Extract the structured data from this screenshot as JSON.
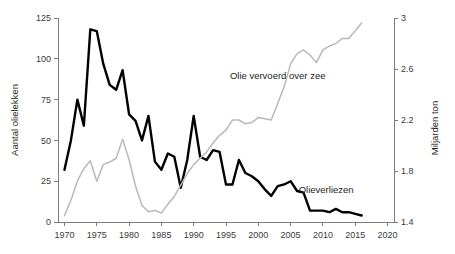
{
  "chart_data": {
    "type": "line",
    "title": "",
    "subtitle": "",
    "xlabel": "",
    "ylabel": "Aantal olielekken",
    "y2label": "Miljarden ton",
    "xlim": [
      1969,
      2021
    ],
    "ylim": [
      0,
      125
    ],
    "y2lim": [
      1.4,
      3.0
    ],
    "grid": false,
    "legend_position": "inline-annotation",
    "xticks": [
      1970,
      1975,
      1980,
      1985,
      1990,
      1995,
      2000,
      2005,
      2010,
      2015,
      2020
    ],
    "xtick_labels": [
      "1970",
      "1975",
      "1980",
      "1985",
      "1990",
      "1995",
      "2000",
      "2005",
      "2010",
      "2015",
      "2020"
    ],
    "yticks": [
      0,
      25,
      50,
      75,
      100,
      125
    ],
    "ytick_labels": [
      "0",
      "25",
      "50",
      "75",
      "100",
      "125"
    ],
    "y2ticks": [
      1.4,
      1.8,
      2.2,
      2.6,
      3.0
    ],
    "y2tick_labels": [
      "1.4",
      "1.8",
      "2.2",
      "2.6",
      "3"
    ],
    "annotations": [
      {
        "text": "Olie vervoerd over zee",
        "x": 2003.0,
        "y_axis": "right",
        "y": 2.52
      },
      {
        "text": "Olieverliezen",
        "x": 2010.5,
        "y_axis": "left",
        "y": 17.5
      }
    ],
    "series": [
      {
        "name": "Olieverliezen",
        "axis": "left",
        "color": "#000000",
        "unit": "aantal olielekken",
        "x": [
          1970,
          1971,
          1972,
          1973,
          1974,
          1975,
          1976,
          1977,
          1978,
          1979,
          1980,
          1981,
          1982,
          1983,
          1984,
          1985,
          1986,
          1987,
          1988,
          1989,
          1990,
          1991,
          1992,
          1993,
          1994,
          1995,
          1996,
          1997,
          1998,
          1999,
          2000,
          2001,
          2002,
          2003,
          2004,
          2005,
          2006,
          2007,
          2008,
          2009,
          2010,
          2011,
          2012,
          2013,
          2014,
          2015,
          2016
        ],
        "values": [
          32,
          50,
          75,
          59,
          118,
          117,
          97,
          84,
          81,
          93,
          66,
          62,
          50,
          65,
          37,
          32,
          42,
          40,
          21,
          38,
          65,
          40,
          38,
          44,
          43,
          23,
          23,
          38,
          30,
          28,
          25,
          20,
          16,
          22,
          23,
          25,
          19,
          18,
          7,
          7,
          7,
          6,
          8,
          6,
          6,
          5,
          4
        ]
      },
      {
        "name": "Olie vervoerd over zee",
        "axis": "right",
        "color": "#b9b9b9",
        "unit": "miljarden ton",
        "x": [
          1970,
          1971,
          1972,
          1973,
          1974,
          1975,
          1976,
          1977,
          1978,
          1979,
          1980,
          1981,
          1982,
          1983,
          1984,
          1985,
          1986,
          1987,
          1988,
          1989,
          1990,
          1991,
          1992,
          1993,
          1994,
          1995,
          1996,
          1997,
          1998,
          1999,
          2000,
          2001,
          2002,
          2003,
          2004,
          2005,
          2006,
          2007,
          2008,
          2009,
          2010,
          2011,
          2012,
          2013,
          2014,
          2015,
          2016
        ],
        "values": [
          1.45,
          1.57,
          1.72,
          1.82,
          1.88,
          1.72,
          1.85,
          1.87,
          1.9,
          2.05,
          1.89,
          1.68,
          1.53,
          1.48,
          1.49,
          1.47,
          1.54,
          1.6,
          1.69,
          1.78,
          1.85,
          1.9,
          1.95,
          2.02,
          2.08,
          2.12,
          2.2,
          2.2,
          2.17,
          2.18,
          2.22,
          2.21,
          2.2,
          2.33,
          2.46,
          2.64,
          2.72,
          2.75,
          2.71,
          2.65,
          2.75,
          2.78,
          2.8,
          2.84,
          2.84,
          2.9,
          2.96
        ]
      }
    ]
  }
}
